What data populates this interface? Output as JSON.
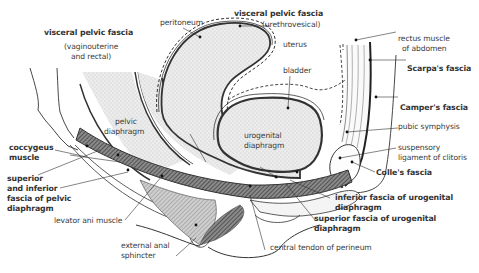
{
  "diagram": {
    "labels": {
      "visceral_vag_title": "visceral pelvic fascia",
      "visceral_vag_sub1": "(vaginouterine",
      "visceral_vag_sub2": "and rectal)",
      "peritoneum": "peritoneum",
      "visceral_ure_title": "visceral pelvic fascia",
      "visceral_ure_sub": "(urethrovesical)",
      "uterus": "uterus",
      "bladder": "bladder",
      "rectus1": "rectus muscle",
      "rectus2": "of abdomen",
      "scarpa": "Scarpa's fascia",
      "camper": "Camper's fascia",
      "pubic": "pubic symphysis",
      "suspensory1": "suspensory",
      "suspensory2": "ligament of clitoris",
      "colles": "Colle's fascia",
      "pelvic_diaphragm1": "pelvic",
      "pelvic_diaphragm2": "diaphragm",
      "urogenital1": "urogenital",
      "urogenital2": "diaphragm",
      "coccygeus1": "coccygeus",
      "coccygeus2": "muscle",
      "sup_inf1": "superior",
      "sup_inf2": "and inferior",
      "sup_inf3": "fascia of pelvic",
      "sup_inf4": "diaphragm",
      "levator": "levator ani muscle",
      "ext_anal1": "external anal",
      "ext_anal2": "sphincter",
      "inf_uro1": "inferior fascia of urogenital",
      "inf_uro2": "diaphragm",
      "sup_uro1": "superior fascia of urogenital",
      "sup_uro2": "diaphragm",
      "central_tendon": "central tendon of perineum"
    },
    "colors": {
      "line": "#333333",
      "stipple": "#e4e4e4",
      "hatch": "#555555",
      "text": "#3a3a3a"
    }
  }
}
